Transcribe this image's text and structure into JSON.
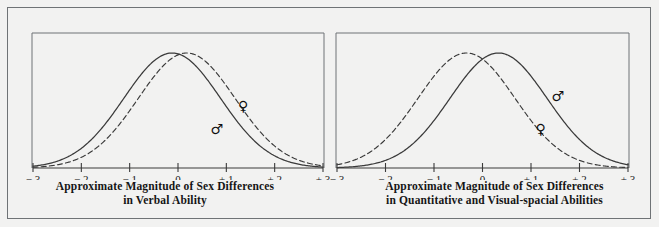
{
  "figure": {
    "background_color": "#f2f2f1",
    "frame_color": "#6f7376",
    "line_color": "#3a3a3a"
  },
  "panels": [
    {
      "id": "verbal",
      "caption_line1": "Approximate Magnitude of Sex Differences",
      "caption_line2": "in Verbal Ability",
      "axis": {
        "ticks": [
          "− 3",
          "− 2",
          "− 1",
          "0",
          "+ 1",
          "+ 2",
          "+ 3"
        ],
        "tick_values": [
          -3,
          -2,
          -1,
          0,
          1,
          2,
          3
        ],
        "min": -3,
        "max": 3
      },
      "symbols": [
        {
          "name": "female-symbol",
          "glyph": "♀",
          "x": 1.35,
          "y": 0.5
        },
        {
          "name": "male-symbol",
          "glyph": "♂",
          "x": 0.8,
          "y": 0.3
        }
      ]
    },
    {
      "id": "quantitative",
      "caption_line1": "Approximate Magnitude of Sex Differences",
      "caption_line2": "in Quantitative and Visual-spacial Abilities",
      "axis": {
        "ticks": [
          "− 3",
          "− 2",
          "− 1",
          "0",
          "+ 1",
          "+ 2",
          "+ 3"
        ],
        "tick_values": [
          -3,
          -2,
          -1,
          0,
          1,
          2,
          3
        ],
        "min": -3,
        "max": 3
      },
      "symbols": [
        {
          "name": "male-symbol",
          "glyph": "♂",
          "x": 1.55,
          "y": 0.58
        },
        {
          "name": "female-symbol",
          "glyph": "♀",
          "x": 1.2,
          "y": 0.3
        }
      ]
    }
  ],
  "chart_data": [
    {
      "type": "line",
      "title": "Approximate Magnitude of Sex Differences in Verbal Ability",
      "xlabel": "",
      "ylabel": "",
      "xlim": [
        -3,
        3
      ],
      "ylim": [
        0,
        1
      ],
      "grid": false,
      "legend": "inline-symbols",
      "x_ticks": [
        -3,
        -2,
        -1,
        0,
        1,
        2,
        3
      ],
      "x_tick_labels": [
        "− 3",
        "− 2",
        "− 1",
        "0",
        "+ 1",
        "+ 2",
        "+ 3"
      ],
      "series": [
        {
          "name": "Males",
          "symbol": "♂",
          "style": "solid",
          "distribution": "normal",
          "mean": -0.12,
          "sd": 1.0,
          "peak_height": 1.0
        },
        {
          "name": "Females",
          "symbol": "♀",
          "style": "dashed",
          "distribution": "normal",
          "mean": 0.18,
          "sd": 1.0,
          "peak_height": 1.0
        }
      ]
    },
    {
      "type": "line",
      "title": "Approximate Magnitude of Sex Differences in Quantitative and Visual-spacial Abilities",
      "xlabel": "",
      "ylabel": "",
      "xlim": [
        -3,
        3
      ],
      "ylim": [
        0,
        1
      ],
      "grid": false,
      "legend": "inline-symbols",
      "x_ticks": [
        -3,
        -2,
        -1,
        0,
        1,
        2,
        3
      ],
      "x_tick_labels": [
        "− 3",
        "− 2",
        "− 1",
        "0",
        "+ 1",
        "+ 2",
        "+ 3"
      ],
      "series": [
        {
          "name": "Females",
          "symbol": "♀",
          "style": "dashed",
          "distribution": "normal",
          "mean": -0.33,
          "sd": 1.0,
          "peak_height": 1.0
        },
        {
          "name": "Males",
          "symbol": "♂",
          "style": "solid",
          "distribution": "normal",
          "mean": 0.33,
          "sd": 1.0,
          "peak_height": 1.0
        }
      ]
    }
  ]
}
